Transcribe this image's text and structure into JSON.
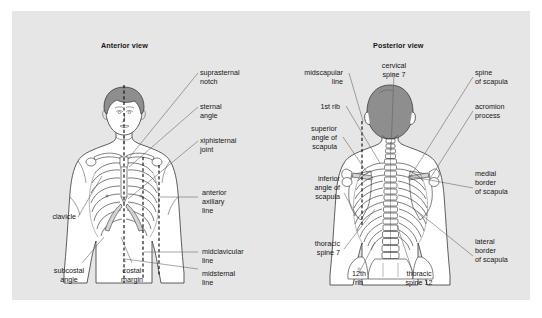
{
  "figure": {
    "background_color": "#e6e6e6",
    "page_color": "#ffffff",
    "line_color": "#5b5b5b",
    "hair_color": "#8e8e8e"
  },
  "anterior": {
    "title": "Anterior view",
    "labels": {
      "suprasternal_notch": "suprasternal\nnotch",
      "sternal_angle": "sternal\nangle",
      "xiphisternal_joint": "xiphisternal\njoint",
      "anterior_axillary_line": "anterior\naxillary\nline",
      "midclavicular_line": "midclavicular\nline",
      "midsternal_line": "midsternal\nline",
      "clavicle": "clavicle",
      "subcostal_angle": "subcostal\nangle",
      "costal_margin": "costal\nmargin"
    }
  },
  "posterior": {
    "title": "Posterior view",
    "labels": {
      "midscapular_line": "midscapular\nline",
      "first_rib": "1st rib",
      "superior_angle_of_scapula": "superior\nangle of\nscapula",
      "cervical_spine_7": "cervical\nspine 7",
      "spine_of_scapula": "spine\nof scapula",
      "acromion_process": "acromion\nprocess",
      "inferior_angle_of_scapula": "inferior\nangle of\nscapula",
      "medial_border_of_scapula": "medial\nborder\nof scapula",
      "thoracic_spine_7": "thoracic\nspine 7",
      "twelfth_rib": "12th\nrib",
      "thoracic_spine_12": "thoracic\nspine 12",
      "lateral_border_of_scapula": "lateral\nborder\nof scapula"
    }
  }
}
